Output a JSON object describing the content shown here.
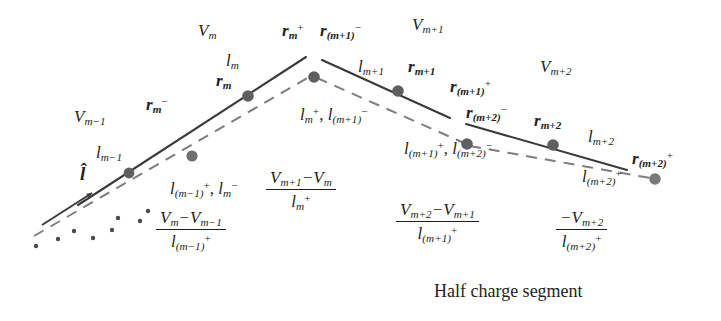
{
  "figure": {
    "caption": "Half charge segment",
    "colors": {
      "line": "#3a3a3a",
      "node": "#6b6b6b",
      "text": "#231f20",
      "background": "#ffffff"
    }
  },
  "potential_labels": [
    {
      "id": "V-m-minus-1",
      "base": "V",
      "sub": "m−1"
    },
    {
      "id": "V-m",
      "base": "V",
      "sub": "m"
    },
    {
      "id": "V-m-plus-1",
      "base": "V",
      "sub": "m+1"
    },
    {
      "id": "V-m-plus-2",
      "base": "V",
      "sub": "m+2"
    }
  ],
  "length_labels": [
    {
      "id": "l-m-minus-1",
      "base": "l",
      "sub": "m−1",
      "sup": ""
    },
    {
      "id": "l-m",
      "base": "l",
      "sub": "m",
      "sup": ""
    },
    {
      "id": "l-m-plus-1",
      "base": "l",
      "sub": "m+1",
      "sup": ""
    },
    {
      "id": "l-m-plus-2",
      "base": "l",
      "sub": "m+2",
      "sup": ""
    }
  ],
  "half_segment_labels": [
    {
      "id": "half-seg-label-1",
      "text_parts": [
        {
          "base": "l",
          "sub": "(m−1)",
          "sup": "+"
        },
        {
          "sep": ", "
        },
        {
          "base": "l",
          "sub": "m",
          "sup": "−"
        }
      ]
    },
    {
      "id": "half-seg-label-2",
      "text_parts": [
        {
          "base": "l",
          "sub": "m",
          "sup": "+"
        },
        {
          "sep": ", "
        },
        {
          "base": "l",
          "sub": "(m+1)",
          "sup": "−"
        }
      ]
    },
    {
      "id": "half-seg-label-3",
      "text_parts": [
        {
          "base": "l",
          "sub": "(m+1)",
          "sup": "+"
        },
        {
          "sep": ", "
        },
        {
          "base": "l",
          "sub": "(m+2)",
          "sup": "−"
        }
      ]
    },
    {
      "id": "half-seg-label-4",
      "text_parts": [
        {
          "base": "l",
          "sub": "(m+2)",
          "sup": "+"
        }
      ]
    }
  ],
  "position_labels": [
    {
      "id": "r-m-minus",
      "base": "r",
      "sub": "m",
      "sup": "−"
    },
    {
      "id": "r-m",
      "base": "r",
      "sub": "m",
      "sup": ""
    },
    {
      "id": "r-m-plus",
      "base": "r",
      "sub": "m",
      "sup": "+"
    },
    {
      "id": "r-m-plus-1-minus",
      "base": "r",
      "sub": "(m+1)",
      "sup": "−"
    },
    {
      "id": "r-m-plus-1",
      "base": "r",
      "sub": "m+1",
      "sup": ""
    },
    {
      "id": "r-m-plus-1-plus",
      "base": "r",
      "sub": "(m+1)",
      "sup": "+"
    },
    {
      "id": "r-m-plus-2-minus",
      "base": "r",
      "sub": "(m+2)",
      "sup": "−"
    },
    {
      "id": "r-m-plus-2",
      "base": "r",
      "sub": "m+2",
      "sup": ""
    },
    {
      "id": "r-m-plus-2-plus",
      "base": "r",
      "sub": "(m+2)",
      "sup": "+"
    }
  ],
  "unit_vector": {
    "id": "l-hat",
    "symbol": "l̂"
  },
  "fractions": [
    {
      "id": "charge-density-m-minus-1",
      "numerator": {
        "left": "V",
        "left_sub": "m",
        "op": "−",
        "right": "V",
        "right_sub": "m−1"
      },
      "denominator": {
        "base": "l",
        "sub": "(m−1)",
        "sup": "+"
      }
    },
    {
      "id": "charge-density-m",
      "numerator": {
        "left": "V",
        "left_sub": "m+1",
        "op": "−",
        "right": "V",
        "right_sub": "m"
      },
      "denominator": {
        "base": "l",
        "sub": "m",
        "sup": "+"
      }
    },
    {
      "id": "charge-density-m-plus-1",
      "numerator": {
        "left": "V",
        "left_sub": "m+2",
        "op": "−",
        "right": "V",
        "right_sub": "m+1"
      },
      "denominator": {
        "base": "l",
        "sub": "(m+1)",
        "sup": "+"
      }
    },
    {
      "id": "charge-density-m-plus-2",
      "numerator": {
        "left": "",
        "left_sub": "",
        "op": "−",
        "right": "V",
        "right_sub": "m+2"
      },
      "denominator": {
        "base": "l",
        "sub": "(m+2)",
        "sup": "+"
      }
    }
  ]
}
